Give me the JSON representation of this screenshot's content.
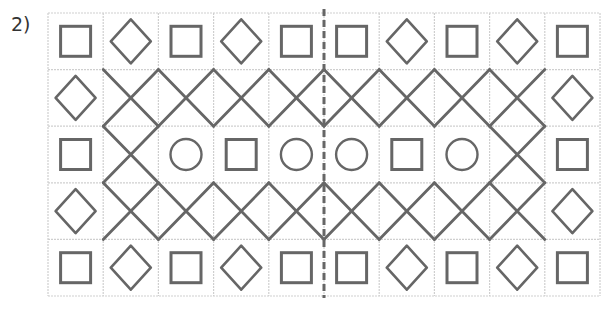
{
  "problem": {
    "label": "2)"
  },
  "grid": {
    "cols": 10,
    "rows": 5,
    "origin_x": 48,
    "origin_y": 13,
    "width": 552,
    "height": 283,
    "line_color": "#cfcfcf",
    "shape_color": "#666666",
    "divider_color": "#666666",
    "divider_style": "dashed",
    "divider_between_cols": [
      5,
      6
    ]
  },
  "cells": [
    [
      "square",
      "diamond",
      "square",
      "diamond",
      "square",
      "square",
      "diamond",
      "square",
      "diamond",
      "square"
    ],
    [
      "diamond",
      "x",
      "x",
      "x",
      "x",
      "x",
      "x",
      "x",
      "x",
      "diamond"
    ],
    [
      "square",
      "x",
      "circle",
      "square",
      "circle",
      "circle",
      "square",
      "circle",
      "x",
      "square"
    ],
    [
      "diamond",
      "x",
      "x",
      "x",
      "x",
      "x",
      "x",
      "x",
      "x",
      "diamond"
    ],
    [
      "square",
      "diamond",
      "square",
      "diamond",
      "square",
      "square",
      "diamond",
      "square",
      "diamond",
      "square"
    ]
  ],
  "legend": {
    "square": "square-icon",
    "diamond": "diamond-icon",
    "circle": "circle-icon",
    "x": "cross-lines"
  }
}
